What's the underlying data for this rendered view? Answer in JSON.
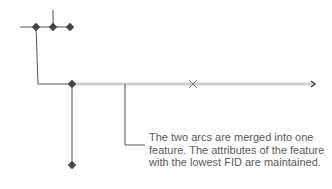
{
  "diagram": {
    "callout_text": "The two arcs are merged into one feature. The attributes of the feature with the lowest FID are maintained.",
    "colors": {
      "line": "#555555",
      "merged_arc": "#cfcfcf",
      "node": "#444444",
      "text": "#5a5a5a"
    },
    "markers": {
      "deleted_vertex": "x-mark",
      "arc_end": "arrow-end"
    }
  }
}
